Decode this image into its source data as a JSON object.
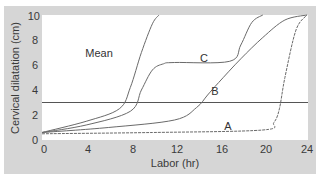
{
  "chart_data": {
    "type": "line",
    "title": "",
    "xlabel": "Labor (hr)",
    "ylabel": "Cervical dilatation (cm)",
    "xlim": [
      0,
      24
    ],
    "ylim": [
      0,
      10
    ],
    "xticks": [
      0,
      4,
      8,
      12,
      16,
      20,
      24
    ],
    "yticks": [
      0,
      2,
      4,
      6,
      8,
      10
    ],
    "grid": false,
    "legend": "none (curves labeled inline)",
    "reference_line": {
      "y": 3,
      "label": ""
    },
    "series": [
      {
        "name": "Mean",
        "x": [
          0,
          4,
          7,
          8,
          9,
          10,
          10.6
        ],
        "y": [
          0.6,
          1.5,
          2.5,
          4.2,
          7,
          9.3,
          10
        ]
      },
      {
        "name": "C",
        "x": [
          0,
          4,
          8,
          9,
          10,
          11,
          12,
          17,
          18,
          19,
          20
        ],
        "y": [
          0.6,
          1.2,
          2.3,
          4,
          5.6,
          6.1,
          6.2,
          6.3,
          7.6,
          9.4,
          10
        ]
      },
      {
        "name": "B",
        "x": [
          0,
          6,
          12,
          14,
          15,
          16,
          18,
          20,
          22,
          24
        ],
        "y": [
          0.6,
          1,
          1.6,
          2.6,
          3.6,
          4.6,
          6.5,
          8.2,
          9.6,
          10
        ]
      },
      {
        "name": "A",
        "x": [
          0,
          10,
          20,
          21,
          21.5,
          22,
          23,
          24
        ],
        "y": [
          0.5,
          0.6,
          0.8,
          1.4,
          2.5,
          5,
          8.8,
          10
        ]
      }
    ],
    "annotations": [
      {
        "text": "Mean",
        "x": 6.5,
        "y": 7.2
      },
      {
        "text": "C",
        "x": 15,
        "y": 6.9
      },
      {
        "text": "B",
        "x": 16,
        "y": 3.9
      },
      {
        "text": "A",
        "x": 17.4,
        "y": 0.9
      }
    ]
  },
  "axis": {
    "xlabel": "Labor (hr)",
    "ylabel": "Cervical dilatation (cm)",
    "xtick_labels": [
      "0",
      "4",
      "8",
      "12",
      "16",
      "20",
      "24"
    ],
    "ytick_labels": [
      "0",
      "2",
      "4",
      "6",
      "8",
      "10"
    ]
  },
  "labels": {
    "mean": "Mean",
    "c": "C",
    "b": "B",
    "a": "A"
  },
  "colors": {
    "panel": "#d6d6d6",
    "plot_bg": "#ffffff",
    "curve": "#6a6a6a",
    "reference_line": "#555555",
    "text": "#3a3a3a"
  }
}
